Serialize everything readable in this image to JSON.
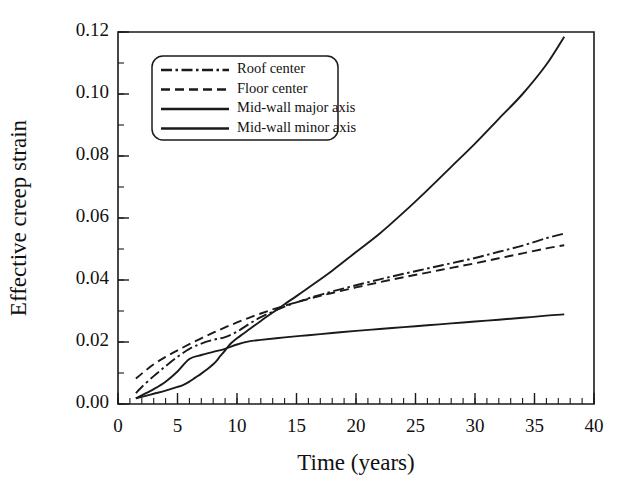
{
  "chart_data": {
    "type": "line",
    "title": "",
    "xlabel": "Time (years)",
    "ylabel": "Effective creep strain",
    "xlim": [
      0,
      40
    ],
    "ylim": [
      0.0,
      0.12
    ],
    "xticks": [
      0,
      5,
      10,
      15,
      20,
      25,
      30,
      35,
      40
    ],
    "xtick_labels": [
      "0",
      "5",
      "10",
      "15",
      "20",
      "25",
      "30",
      "35",
      "40"
    ],
    "yticks": [
      0.0,
      0.02,
      0.04,
      0.06,
      0.08,
      0.1,
      0.12
    ],
    "ytick_labels": [
      "0.00",
      "0.02",
      "0.04",
      "0.06",
      "0.08",
      "0.10",
      "0.12"
    ],
    "x_minor_tick_step": 1,
    "y_minor_tick_step": 0.01,
    "grid": false,
    "legend_position": "upper-left-inside",
    "line_color": "#1a1a1a",
    "series": [
      {
        "name": "Roof center",
        "style": "dashdot",
        "dasharray": "11,3.5,2.5,3.5",
        "x": [
          1.5,
          2.0,
          3.0,
          4.0,
          5.0,
          6.0,
          7.0,
          8.0,
          9.0,
          10.0,
          11.0,
          12.0,
          13.0,
          14.0,
          15.0,
          16.0,
          17.0,
          18.0,
          20.0,
          22.0,
          24.0,
          26.0,
          28.0,
          30.0,
          32.0,
          34.0,
          36.0,
          37.5
        ],
        "y": [
          0.0035,
          0.0055,
          0.009,
          0.0122,
          0.0152,
          0.0178,
          0.0195,
          0.0207,
          0.0216,
          0.0233,
          0.0258,
          0.028,
          0.0298,
          0.0314,
          0.0328,
          0.0341,
          0.0352,
          0.0363,
          0.0383,
          0.0402,
          0.042,
          0.0437,
          0.0454,
          0.0471,
          0.0491,
          0.0511,
          0.0535,
          0.055
        ]
      },
      {
        "name": "Floor center",
        "style": "dashed",
        "dasharray": "9,5",
        "x": [
          1.5,
          2.0,
          3.0,
          4.0,
          5.0,
          6.0,
          7.0,
          8.0,
          9.0,
          10.0,
          11.0,
          12.0,
          13.0,
          14.0,
          15.0,
          16.0,
          17.0,
          18.0,
          20.0,
          22.0,
          24.0,
          26.0,
          28.0,
          30.0,
          32.0,
          34.0,
          36.0,
          37.5
        ],
        "y": [
          0.0082,
          0.0098,
          0.0128,
          0.0152,
          0.0173,
          0.0193,
          0.0212,
          0.023,
          0.0247,
          0.0263,
          0.0278,
          0.0292,
          0.0305,
          0.0317,
          0.0328,
          0.0339,
          0.0349,
          0.0358,
          0.0376,
          0.0393,
          0.0409,
          0.0424,
          0.0439,
          0.0454,
          0.047,
          0.0486,
          0.0502,
          0.0512
        ]
      },
      {
        "name": "Mid-wall major axis",
        "style": "solid",
        "dasharray": "",
        "x": [
          1.5,
          2.0,
          3.0,
          4.0,
          5.0,
          6.0,
          7.0,
          8.0,
          9.0,
          10.0,
          11.0,
          12.0,
          14.0,
          16.0,
          18.0,
          20.0,
          22.0,
          24.0,
          26.0,
          28.0,
          30.0,
          32.0,
          34.0,
          36.0,
          37.5
        ],
        "y": [
          0.0018,
          0.0028,
          0.0048,
          0.0072,
          0.0105,
          0.0145,
          0.0158,
          0.0168,
          0.0178,
          0.0192,
          0.0202,
          0.0207,
          0.0215,
          0.0222,
          0.0229,
          0.0236,
          0.0242,
          0.0248,
          0.0254,
          0.026,
          0.0266,
          0.0272,
          0.0278,
          0.0285,
          0.0289
        ]
      },
      {
        "name": "Mid-wall minor axis",
        "style": "solid",
        "dasharray": "",
        "x": [
          1.5,
          2.0,
          3.0,
          4.0,
          5.0,
          5.5,
          6.0,
          6.5,
          7.0,
          7.5,
          8.0,
          8.3,
          8.6,
          8.9,
          9.2,
          9.5,
          10.0,
          10.5,
          11.0,
          12.0,
          13.0,
          14.0,
          15.0,
          16.0,
          18.0,
          20.0,
          22.0,
          24.0,
          26.0,
          28.0,
          30.0,
          32.0,
          34.0,
          36.0,
          37.5
        ],
        "y": [
          0.0018,
          0.0023,
          0.0033,
          0.0043,
          0.0055,
          0.0062,
          0.0072,
          0.0085,
          0.0098,
          0.0112,
          0.0128,
          0.014,
          0.0155,
          0.0168,
          0.0183,
          0.0196,
          0.0212,
          0.0226,
          0.024,
          0.0268,
          0.0295,
          0.0322,
          0.0348,
          0.0375,
          0.043,
          0.049,
          0.055,
          0.0618,
          0.069,
          0.0765,
          0.084,
          0.092,
          0.1,
          0.1095,
          0.1185
        ]
      }
    ]
  },
  "legend": {
    "items": [
      {
        "label": "Roof center"
      },
      {
        "label": "Floor center"
      },
      {
        "label": "Mid-wall major axis"
      },
      {
        "label": "Mid-wall minor axis"
      }
    ]
  }
}
